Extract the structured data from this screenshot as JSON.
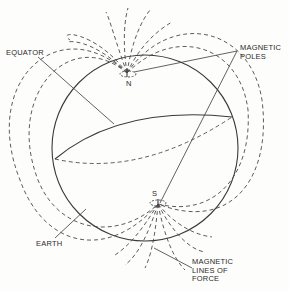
{
  "diagram": {
    "labels": {
      "equator": "EQUATOR",
      "magnetic_poles": "MAGNETIC\nPOLES",
      "north": "N",
      "south": "S",
      "earth": "EARTH",
      "magnetic_lines_of_force": "MAGNETIC\nLINES OF\nFORCE"
    },
    "colors": {
      "line": "#3a3a3a",
      "background": "#fdfdfc"
    }
  }
}
